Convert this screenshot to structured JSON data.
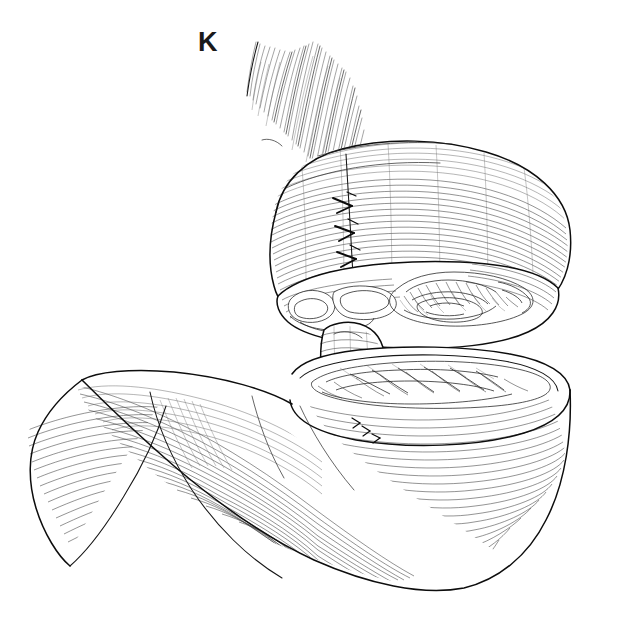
{
  "figure": {
    "panel_label": "K",
    "kind": "medical-line-art-illustration",
    "style": "pen-and-ink hatching, black line on white",
    "background_color": "#ffffff",
    "ink_color": "#111111",
    "hatch_color": "#3a3a3a"
  },
  "parts": {
    "esophagus": {
      "name": "esophagus",
      "description": "longitudinal muscle fibers splayed upward at top of figure"
    },
    "upper_pouch": {
      "name": "upper-gastric-pouch",
      "description": "rounded proximal pouch with circumferential serosal hatching"
    },
    "suture_line": {
      "name": "suture-line",
      "description": "vertical row of interrupted stitches on the anterior pouch wall",
      "stitch_count": 6
    },
    "cut_edge_upper": {
      "name": "upper-cut-edge",
      "description": "transected rim of the upper pouch revealing mucosa"
    },
    "mucosa_upper": {
      "name": "upper-mucosal-folds",
      "description": "rugae on the inner surface of the upper pouch cross-section"
    },
    "flap": {
      "name": "tongue-flap",
      "description": "tongue-shaped tissue flap hanging between the divided segments"
    },
    "lower_stomach": {
      "name": "lower-gastric-remnant",
      "description": "distal stomach body and antrum with dense curved hatching"
    },
    "cut_edge_lower": {
      "name": "lower-cut-edge",
      "description": "open transected rim of the distal remnant"
    },
    "mucosa_lower": {
      "name": "lower-mucosal-folds",
      "description": "rugae visible inside the open distal remnant"
    },
    "duodenum_end": {
      "name": "distal-tail",
      "description": "tapering pyloric / duodenal end at lower left"
    }
  }
}
